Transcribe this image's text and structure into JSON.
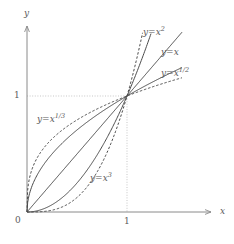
{
  "chart_data": {
    "type": "line",
    "title": "",
    "xlabel": "x",
    "ylabel": "y",
    "xlim": [
      0,
      1.55
    ],
    "ylim": [
      0,
      1.55
    ],
    "xticks": [
      0,
      1
    ],
    "yticks": [
      1
    ],
    "xticklabels": [
      "0",
      "1"
    ],
    "yticklabels": [
      "1"
    ],
    "grid": "dotted guide lines at x=1 and y=1 meeting at the point (1,1)",
    "legend": "inline curve labels",
    "annotations": [
      {
        "text": "y=x²",
        "x": 1.22,
        "y": 1.52
      },
      {
        "text": "y=x",
        "x": 1.4,
        "y": 1.3
      },
      {
        "text": "y=x¹ᐟ²",
        "x": 1.4,
        "y": 1.08
      },
      {
        "text": "y=x¹ᐟ³",
        "x": 0.22,
        "y": 0.82
      },
      {
        "text": "y=x³",
        "x": 0.68,
        "y": 0.37
      }
    ],
    "series": [
      {
        "name": "y=x^3",
        "exponent": 3,
        "style": "dashed",
        "label": "y=x³",
        "label_base": "y=x",
        "label_exp": "3",
        "points_x": [
          0,
          0.1,
          0.2,
          0.3,
          0.4,
          0.5,
          0.6,
          0.7,
          0.8,
          0.9,
          1.0,
          1.1,
          1.15
        ],
        "points_y": [
          0,
          0.001,
          0.008,
          0.027,
          0.064,
          0.125,
          0.216,
          0.343,
          0.512,
          0.729,
          1.0,
          1.331,
          1.52
        ]
      },
      {
        "name": "y=x^2",
        "exponent": 2,
        "style": "solid",
        "label": "y=x²",
        "label_base": "y=x",
        "label_exp": "2",
        "points_x": [
          0,
          0.1,
          0.2,
          0.3,
          0.4,
          0.5,
          0.6,
          0.7,
          0.8,
          0.9,
          1.0,
          1.1,
          1.2,
          1.23
        ],
        "points_y": [
          0,
          0.01,
          0.04,
          0.09,
          0.16,
          0.25,
          0.36,
          0.49,
          0.64,
          0.81,
          1.0,
          1.21,
          1.44,
          1.51
        ]
      },
      {
        "name": "y=x",
        "exponent": 1,
        "style": "solid",
        "label": "y=x",
        "label_base": "y=x",
        "label_exp": "",
        "points_x": [
          0,
          0.25,
          0.5,
          0.75,
          1.0,
          1.25,
          1.5
        ],
        "points_y": [
          0,
          0.25,
          0.5,
          0.75,
          1.0,
          1.25,
          1.5
        ]
      },
      {
        "name": "y=x^1/2",
        "exponent": 0.5,
        "style": "solid",
        "label": "y=x¹ᐟ²",
        "label_base": "y=x",
        "label_exp": "1/2",
        "points_x": [
          0,
          0.05,
          0.1,
          0.2,
          0.3,
          0.4,
          0.5,
          0.6,
          0.7,
          0.8,
          0.9,
          1.0,
          1.2,
          1.4,
          1.5
        ],
        "points_y": [
          0,
          0.224,
          0.316,
          0.447,
          0.548,
          0.632,
          0.707,
          0.775,
          0.837,
          0.894,
          0.949,
          1.0,
          1.095,
          1.183,
          1.225
        ]
      },
      {
        "name": "y=x^1/3",
        "exponent": 0.333333,
        "style": "dashed",
        "label": "y=x¹ᐟ³",
        "label_base": "y=x",
        "label_exp": "1/3",
        "points_x": [
          0,
          0.02,
          0.05,
          0.1,
          0.2,
          0.3,
          0.4,
          0.5,
          0.6,
          0.7,
          0.8,
          0.9,
          1.0,
          1.2,
          1.4,
          1.5
        ],
        "points_y": [
          0,
          0.271,
          0.368,
          0.464,
          0.585,
          0.669,
          0.737,
          0.794,
          0.843,
          0.888,
          0.928,
          0.965,
          1.0,
          1.063,
          1.119,
          1.145
        ]
      }
    ]
  },
  "axes": {
    "y_name": "y",
    "x_name": "x",
    "origin_label": "0",
    "x_one_label": "1",
    "y_one_label": "1"
  },
  "colors": {
    "curve": "#4a4a4a",
    "axis": "#8a8a8a",
    "grid": "#b9b9b9",
    "text": "#5a5a5a",
    "background": "#ffffff"
  }
}
